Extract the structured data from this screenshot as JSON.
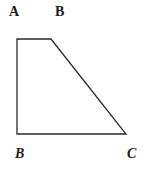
{
  "diagram": {
    "type": "geometry-trapezoid",
    "stroke_color": "#2a2a2a",
    "background": "#ffffff",
    "vertices": [
      {
        "x": 17,
        "y": 39
      },
      {
        "x": 51,
        "y": 39
      },
      {
        "x": 126,
        "y": 134
      },
      {
        "x": 17,
        "y": 134
      }
    ],
    "labels": {
      "top_left": "A",
      "top_right": "B",
      "bottom_left": "B",
      "bottom_right": "C"
    }
  }
}
